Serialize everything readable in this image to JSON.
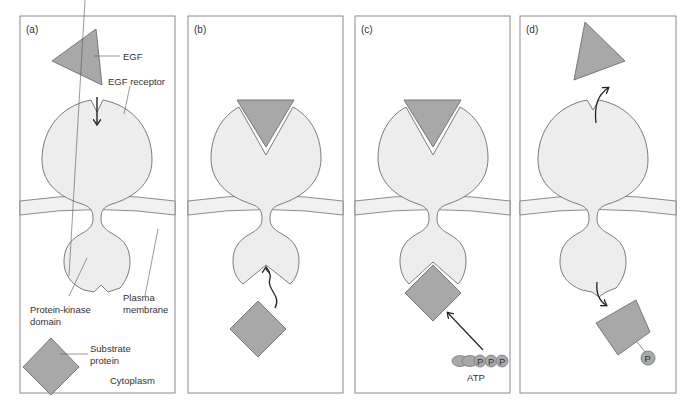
{
  "figure": {
    "panels": [
      {
        "id": "a",
        "label": "(a)"
      },
      {
        "id": "b",
        "label": "(b)"
      },
      {
        "id": "c",
        "label": "(c)"
      },
      {
        "id": "d",
        "label": "(d)"
      }
    ],
    "labels": {
      "egf": "EGF",
      "egf_receptor": "EGF receptor",
      "protein_kinase_line1": "Protein-kinase",
      "protein_kinase_line2": "domain",
      "plasma_line1": "Plasma",
      "plasma_line2": "membrane",
      "substrate_line1": "Substrate",
      "substrate_line2": "protein",
      "cytoplasm": "Cytoplasm",
      "atp": "ATP",
      "phosphate": "P"
    },
    "colors": {
      "receptor_fill": "#ededed",
      "ligand_fill": "#a8a8a8",
      "membrane_fill": "#f1f1f1",
      "outline": "#6e6e6e",
      "panel_border": "#8a8a8a"
    }
  }
}
